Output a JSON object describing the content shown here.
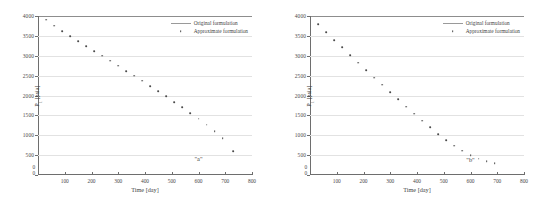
{
  "figure": {
    "panel_count": 2,
    "colors": {
      "marker": "#4a4a4a",
      "axis": "#6e6e6e",
      "grid": "#e2e2e2",
      "frame_top": "#8d8d8d",
      "background": "#ffffff",
      "text": "#3f3f3f"
    }
  },
  "legend": {
    "position": "top-right",
    "entries": [
      {
        "label": "Original formulation",
        "key": "line"
      },
      {
        "label": "Approximate formulation",
        "key": "dot"
      }
    ]
  },
  "axes": {
    "xlabel": "Time [day]",
    "ylabel_main": "P",
    "ylabel_sub": "1",
    "ylabel_unit": " [psia]",
    "origin_label_x": "0",
    "origin_label_y": "0",
    "xticks": [
      0,
      100,
      200,
      300,
      400,
      500,
      600,
      700,
      800
    ],
    "yticks": [
      0,
      500,
      1000,
      1500,
      2000,
      2500,
      3000,
      3500,
      4000
    ],
    "xlim": [
      0,
      800
    ],
    "ylim": [
      0,
      4000
    ]
  },
  "chart_data": [
    {
      "type": "scatter",
      "panel": "a",
      "annotation": "\"a\"",
      "annotation_x": 600,
      "annotation_y": 430,
      "title": "",
      "xlabel": "Time [day]",
      "ylabel": "P1 [psia]",
      "xlim": [
        0,
        800
      ],
      "ylim": [
        0,
        4000
      ],
      "grid": "horizontal",
      "legend": [
        "Original formulation",
        "Approximate formulation"
      ],
      "series": [
        {
          "name": "Approximate formulation",
          "x": [
            30,
            60,
            90,
            120,
            150,
            180,
            210,
            240,
            270,
            300,
            330,
            360,
            390,
            420,
            450,
            480,
            510,
            540,
            570,
            600,
            630,
            660,
            690,
            730
          ],
          "y": [
            3910,
            3760,
            3620,
            3490,
            3360,
            3240,
            3120,
            3000,
            2880,
            2750,
            2620,
            2500,
            2370,
            2240,
            2110,
            1980,
            1840,
            1700,
            1560,
            1420,
            1270,
            1110,
            930,
            600
          ]
        }
      ]
    },
    {
      "type": "scatter",
      "panel": "b",
      "annotation": "\"b\"",
      "annotation_x": 600,
      "annotation_y": 400,
      "title": "",
      "xlabel": "Time [day]",
      "ylabel": "P1 [psia]",
      "xlim": [
        0,
        800
      ],
      "ylim": [
        0,
        4000
      ],
      "grid": "horizontal",
      "legend": [
        "Original formulation",
        "Approximate formulation"
      ],
      "series": [
        {
          "name": "Approximate formulation",
          "x": [
            30,
            60,
            90,
            120,
            150,
            180,
            210,
            240,
            270,
            300,
            330,
            360,
            390,
            420,
            450,
            480,
            510,
            540,
            570,
            600,
            630,
            660,
            690
          ],
          "y": [
            3790,
            3590,
            3400,
            3210,
            3020,
            2830,
            2640,
            2450,
            2270,
            2080,
            1900,
            1720,
            1540,
            1370,
            1200,
            1030,
            880,
            740,
            610,
            500,
            410,
            345,
            300
          ]
        }
      ]
    }
  ]
}
